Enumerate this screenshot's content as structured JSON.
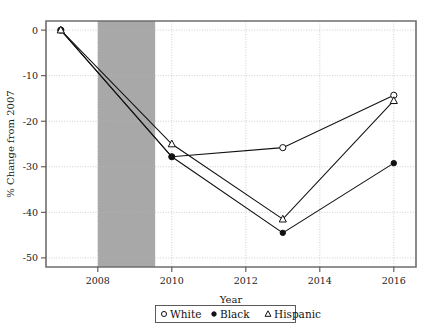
{
  "chart_data": {
    "type": "line",
    "title": "",
    "xlabel": "Year",
    "ylabel": "% Change from 2007",
    "xlim": [
      2006.6,
      2016.6
    ],
    "ylim": [
      -52,
      2
    ],
    "xticks": [
      "2008",
      "2010",
      "2012",
      "2014",
      "2016"
    ],
    "xtick_values": [
      2008,
      2010,
      2012,
      2014,
      2016
    ],
    "yticks": [
      "0",
      "-10",
      "-20",
      "-30",
      "-40",
      "-50"
    ],
    "ytick_values": [
      0,
      -10,
      -20,
      -30,
      -40,
      -50
    ],
    "grid": "dotted horizontal and vertical gridlines",
    "legend_position": "below axis, centered, boxed",
    "x": [
      2007,
      2010,
      2013,
      2016
    ],
    "series": [
      {
        "name": "White",
        "marker": "open-circle",
        "values": [
          0,
          -27.8,
          -25.8,
          -14.3
        ]
      },
      {
        "name": "Black",
        "marker": "filled-circle",
        "values": [
          0,
          -27.8,
          -44.5,
          -29.2
        ]
      },
      {
        "name": "Hispanic",
        "marker": "open-triangle",
        "values": [
          0,
          -25.0,
          -41.5,
          -15.5
        ]
      }
    ],
    "annotations": [
      {
        "type": "shaded-band",
        "name": "recession-band",
        "x_start": 2008.0,
        "x_end": 2009.55,
        "color": "#a8a8a8"
      }
    ]
  },
  "legend": {
    "entries": [
      {
        "label": "White",
        "marker": "open-circle"
      },
      {
        "label": "Black",
        "marker": "filled-circle"
      },
      {
        "label": "Hispanic",
        "marker": "open-triangle"
      }
    ]
  },
  "colors": {
    "line": "#111111",
    "band": "#a8a8a8",
    "grid": "#b9b9b9",
    "axis": "#6e6e6e",
    "background": "#ffffff"
  }
}
